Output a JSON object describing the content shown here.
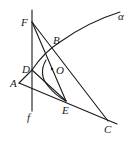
{
  "diagram": {
    "type": "geometry",
    "labels": {
      "F": "F",
      "B": "B",
      "D": "D",
      "A": "A",
      "O": "O",
      "E": "E",
      "C": "C",
      "f": "f",
      "alpha": "α"
    },
    "points": {
      "F": [
        32,
        22
      ],
      "B": [
        52,
        48
      ],
      "D": [
        32,
        70
      ],
      "A": [
        19,
        83
      ],
      "O": [
        52,
        69
      ],
      "E": [
        66,
        101
      ],
      "C": [
        108,
        121
      ]
    },
    "line_f": {
      "x": 32,
      "y_top": 10,
      "y_bottom": 111
    },
    "segments": [
      [
        "F",
        "C"
      ],
      [
        "F",
        "E"
      ],
      [
        "A",
        "D"
      ],
      [
        "A",
        "C"
      ],
      [
        "D",
        "E"
      ]
    ],
    "curves": [
      "alpha (parabola-like arc through D and B)",
      "inner arc toward E"
    ],
    "colors": {
      "stroke": "#1a1a1a",
      "background": "#ffffff"
    }
  }
}
